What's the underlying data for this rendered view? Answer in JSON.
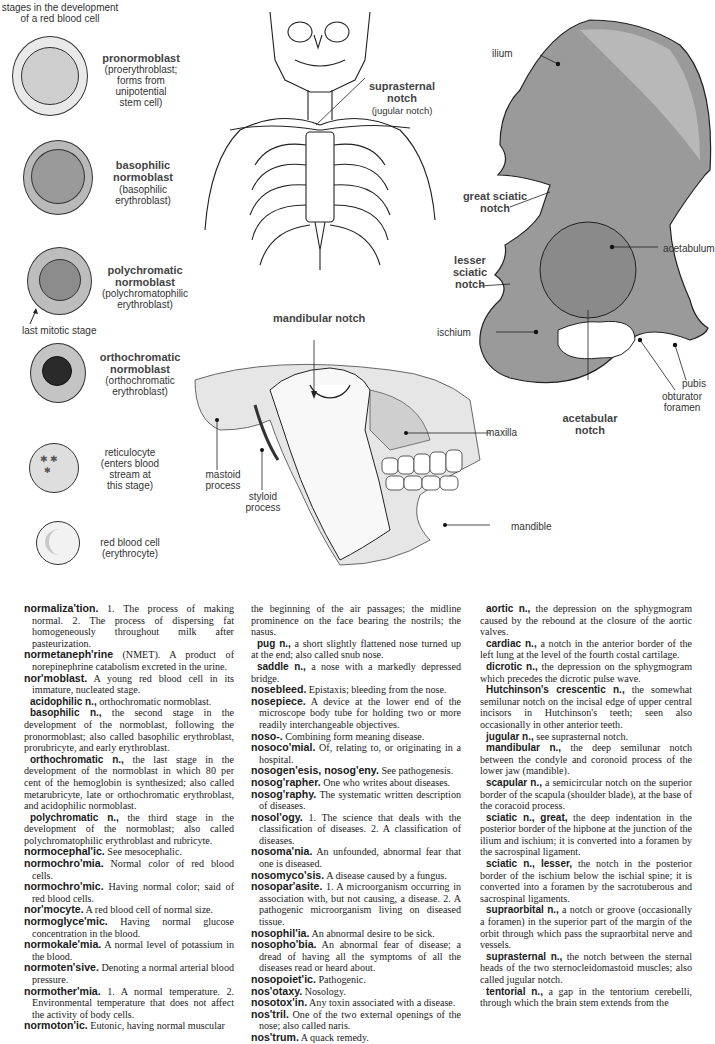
{
  "cells_figure": {
    "title_line1": "stages in the development",
    "title_line2": "of a red blood cell",
    "stages": [
      {
        "name": "pronormoblast",
        "name2": "",
        "detail": [
          "(proerythroblast;",
          "forms from",
          "unipotential",
          "stem cell)"
        ]
      },
      {
        "name": "basophilic",
        "name2": "normoblast",
        "detail": [
          "(basophilic",
          "erythroblast)"
        ]
      },
      {
        "name": "polychromatic",
        "name2": "normoblast",
        "detail": [
          "(polychromatophilic",
          "erythroblast)"
        ]
      },
      {
        "name": "orthochromatic",
        "name2": "normoblast",
        "detail": [
          "(orthochromatic",
          "erythroblast)"
        ]
      },
      {
        "name": "",
        "name2": "",
        "detail": [
          "reticulocyte",
          "(enters blood",
          "stream at",
          "this stage)"
        ]
      },
      {
        "name": "",
        "name2": "",
        "detail": [
          "red blood cell",
          "(erythrocyte)"
        ]
      }
    ],
    "mitotic_label": "last mitotic stage"
  },
  "skeleton_figure": {
    "label_bold": [
      "suprasternal",
      "notch"
    ],
    "label_sub": "(jugular notch)"
  },
  "jaw_figure": {
    "title": "mandibular notch",
    "labels": {
      "mastoid": [
        "mastoid",
        "process"
      ],
      "styloid": [
        "styloid",
        "process"
      ],
      "maxilla": "maxilla",
      "mandible": "mandible"
    }
  },
  "hip_figure": {
    "labels": {
      "ilium": "ilium",
      "great_sciatic": [
        "great sciatic",
        "notch"
      ],
      "acetabulum": "acetabulum",
      "lesser_sciatic": [
        "lesser",
        "sciatic",
        "notch"
      ],
      "ischium": "ischium",
      "pubis": "pubis",
      "obturator": [
        "obturator",
        "foramen"
      ],
      "acetabular": [
        "acetabular",
        "notch"
      ]
    }
  },
  "dictionary": {
    "col1": [
      {
        "type": "e",
        "hw": "normaliza'tion.",
        "text": " 1. The process of making normal. 2. The process of dispersing fat homogeneously throughout milk after pasteurization."
      },
      {
        "type": "e",
        "hw": "normetaneph'rine",
        "text": " (NMET). A product of norepinephrine catabolism excreted in the urine."
      },
      {
        "type": "e",
        "hw": "nor'moblast.",
        "text": " A young red blood cell in its immature, nucleated stage."
      },
      {
        "type": "s",
        "hw": "acidophilic n.,",
        "text": " orthochromatic normoblast."
      },
      {
        "type": "s",
        "hw": "basophilic n.,",
        "text": " the second stage in the development of the normoblast, following the pronormoblast; also called basophilic erythroblast, prorubricyte, and early erythroblast."
      },
      {
        "type": "s",
        "hw": "orthochromatic n.,",
        "text": " the last stage in the development of the normoblast in which 80 per cent of the hemoglobin is synthesized; also called metarubricyte, late or orthochromatic erythroblast, and acidophilic normoblast."
      },
      {
        "type": "s",
        "hw": "polychromatic n.,",
        "text": " the third stage in the development of the normoblast; also called polychromatophilic erythroblast and rubricyte."
      },
      {
        "type": "e",
        "hw": "normocephal'ic.",
        "text": " See mesocephalic."
      },
      {
        "type": "e",
        "hw": "normochro'mia.",
        "text": " Normal color of red blood cells."
      },
      {
        "type": "e",
        "hw": "normochro'mic.",
        "text": " Having normal color; said of red blood cells."
      },
      {
        "type": "e",
        "hw": "nor'mocyte.",
        "text": " A red blood cell of normal size."
      },
      {
        "type": "e",
        "hw": "normoglyce'mic.",
        "text": " Having normal glucose concentration in the blood."
      },
      {
        "type": "e",
        "hw": "normokale'mia.",
        "text": " A normal level of potassium in the blood."
      },
      {
        "type": "e",
        "hw": "normoten'sive.",
        "text": " Denoting a normal arterial blood pressure."
      },
      {
        "type": "e",
        "hw": "normother'mia.",
        "text": " 1. A normal temperature. 2. Environmental temperature that does not affect the activity of body cells."
      },
      {
        "type": "e",
        "hw": "normoton'ic.",
        "text": " Eutonic, having normal muscular"
      }
    ],
    "col2": [
      {
        "type": "c",
        "hw": "",
        "text": "the beginning of the air passages; the midline prominence on the face bearing the nostrils; the nasus."
      },
      {
        "type": "s",
        "hw": "pug n.,",
        "text": " a short slightly flattened nose turned up at the end; also called snub nose."
      },
      {
        "type": "s",
        "hw": "saddle n.,",
        "text": " a nose with a markedly depressed bridge."
      },
      {
        "type": "e",
        "hw": "nosebleed.",
        "text": " Epistaxis; bleeding from the nose."
      },
      {
        "type": "e",
        "hw": "nosepiece.",
        "text": " A device at the lower end of the microscope body tube for holding two or more readily interchangeable objectives."
      },
      {
        "type": "e",
        "hw": "noso-.",
        "text": " Combining form meaning disease."
      },
      {
        "type": "e",
        "hw": "nosoco'mial.",
        "text": " Of, relating to, or originating in a hospital."
      },
      {
        "type": "e",
        "hw": "nosogen'esis, nosog'eny.",
        "text": " See pathogenesis."
      },
      {
        "type": "e",
        "hw": "nosog'rapher.",
        "text": " One who writes about diseases."
      },
      {
        "type": "e",
        "hw": "nosog'raphy.",
        "text": " The systematic written description of diseases."
      },
      {
        "type": "e",
        "hw": "nosol'ogy.",
        "text": " 1. The science that deals with the classification of diseases. 2. A classification of diseases."
      },
      {
        "type": "e",
        "hw": "nosoma'nia.",
        "text": " An unfounded, abnormal fear that one is diseased."
      },
      {
        "type": "e",
        "hw": "nosomyco'sis.",
        "text": " A disease caused by a fungus."
      },
      {
        "type": "e",
        "hw": "nosopar'asite.",
        "text": " 1. A microorganism occurring in association with, but not causing, a disease. 2. A pathogenic microorganism living on diseased tissue."
      },
      {
        "type": "e",
        "hw": "nosophil'ia.",
        "text": " An abnormal desire to be sick."
      },
      {
        "type": "e",
        "hw": "nosopho'bia.",
        "text": " An abnormal fear of disease; a dread of having all the symptoms of all the diseases read or heard about."
      },
      {
        "type": "e",
        "hw": "nosopoiet'ic.",
        "text": " Pathogenic."
      },
      {
        "type": "e",
        "hw": "nos'otaxy.",
        "text": " Nosology."
      },
      {
        "type": "e",
        "hw": "nosotox'in.",
        "text": " Any toxin associated with a disease."
      },
      {
        "type": "e",
        "hw": "nos'tril.",
        "text": " One of the two external openings of the nose; also called naris."
      },
      {
        "type": "e",
        "hw": "nos'trum.",
        "text": " A quack remedy."
      }
    ],
    "col3": [
      {
        "type": "s",
        "hw": "aortic n.,",
        "text": " the depression on the sphygmogram caused by the rebound at the closure of the aortic valves."
      },
      {
        "type": "s",
        "hw": "cardiac n.,",
        "text": " a notch in the anterior border of the left lung at the level of the fourth costal cartilage."
      },
      {
        "type": "s",
        "hw": "dicrotic n.,",
        "text": " the depression on the sphygmogram which precedes the dicrotic pulse wave."
      },
      {
        "type": "s",
        "hw": "Hutchinson's crescentic n.,",
        "text": " the somewhat semilunar notch on the incisal edge of upper central incisors in Hutchinson's teeth; seen also occasionally in other anterior teeth."
      },
      {
        "type": "s",
        "hw": "jugular n.,",
        "text": " see suprasternal notch."
      },
      {
        "type": "s",
        "hw": "mandibular n.,",
        "text": " the deep semilunar notch between the condyle and coronoid process of the lower jaw (mandible)."
      },
      {
        "type": "s",
        "hw": "scapular n.,",
        "text": " a semicircular notch on the superior border of the scapula (shoulder blade), at the base of the coracoid process."
      },
      {
        "type": "s",
        "hw": "sciatic n., great,",
        "text": " the deep indentation in the posterior border of the hipbone at the junction of the ilium and ischium; it is converted into a foramen by the sacrospinal ligament."
      },
      {
        "type": "s",
        "hw": "sciatic n., lesser,",
        "text": " the notch in the posterior border of the ischium below the ischial spine; it is converted into a foramen by the sacrotuberous and sacrospinal ligaments."
      },
      {
        "type": "s",
        "hw": "supraorbital n.,",
        "text": " a notch or groove (occasionally a foramen) in the superior part of the margin of the orbit through which pass the supraorbital nerve and vessels."
      },
      {
        "type": "s",
        "hw": "suprasternal n.,",
        "text": " the notch between the sternal heads of the two sternocleidomastoid muscles; also called jugular notch."
      },
      {
        "type": "s",
        "hw": "tentorial n.,",
        "text": " a gap in the tentorium cerebelli, through which the brain stem extends from the"
      }
    ]
  }
}
